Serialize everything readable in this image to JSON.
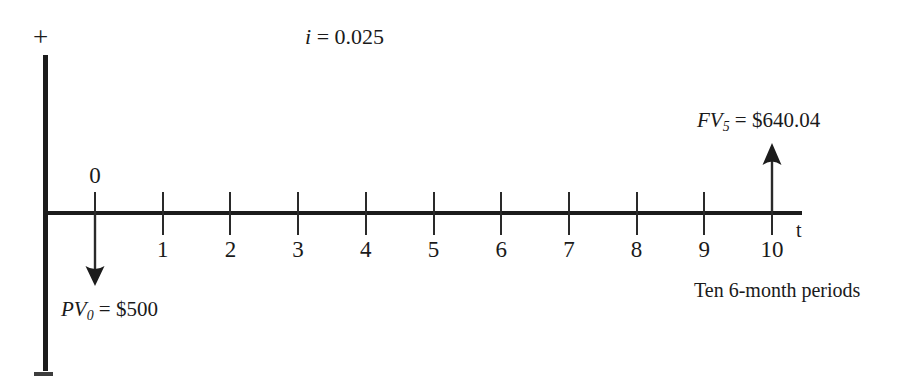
{
  "diagram": {
    "rate_label": {
      "symbol": "i",
      "equals": " = ",
      "value": "0.025"
    },
    "axis": {
      "positive_sign": "+",
      "negative_sign": "−",
      "time_axis_label": "t"
    },
    "timeline": {
      "tick_labels": [
        "0",
        "1",
        "2",
        "3",
        "4",
        "5",
        "6",
        "7",
        "8",
        "9",
        "10"
      ],
      "zero_label_above": "0",
      "caption": "Ten 6-month periods"
    },
    "cash_flows": [
      {
        "name": "present-value",
        "period": "0",
        "direction": "down",
        "symbol": "PV",
        "subscript": "0",
        "equals": " = ",
        "amount": "$500",
        "full_text": "PV0 = $500"
      },
      {
        "name": "future-value",
        "period": "10",
        "direction": "up",
        "symbol": "FV",
        "subscript": "5",
        "equals": " = ",
        "amount": "$640.04",
        "full_text": "FV5 = $640.04"
      }
    ],
    "colors": {
      "ink": "#1c1c1c",
      "background": "#ffffff"
    }
  }
}
